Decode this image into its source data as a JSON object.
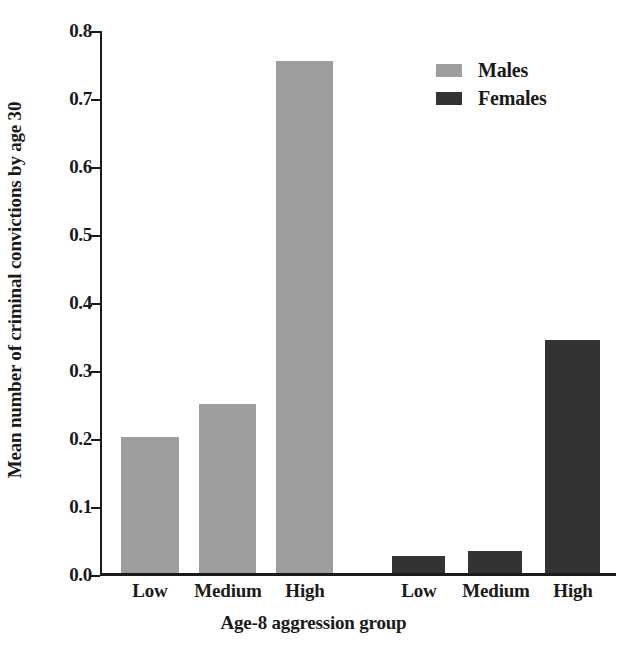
{
  "chart_data": {
    "type": "bar",
    "title": "",
    "xlabel": "Age-8 aggression group",
    "ylabel": "Mean number of criminal convictions by age 30",
    "categories": [
      "Low",
      "Medium",
      "High"
    ],
    "series": [
      {
        "name": "Males",
        "color": "#9e9e9e",
        "values": [
          0.2,
          0.248,
          0.753
        ]
      },
      {
        "name": "Females",
        "color": "#333333",
        "values": [
          0.025,
          0.032,
          0.342
        ]
      }
    ],
    "ylim": [
      0.0,
      0.8
    ],
    "yticks": [
      "0.0",
      "0.1",
      "0.2",
      "0.3",
      "0.4",
      "0.5",
      "0.6",
      "0.7",
      "0.8"
    ],
    "ytick_values": [
      0.0,
      0.1,
      0.2,
      0.3,
      0.4,
      0.5,
      0.6,
      0.7,
      0.8
    ],
    "grid": false,
    "legend_position": "top-right",
    "group_labels": [
      "Low",
      "Medium",
      "High",
      "Low",
      "Medium",
      "High"
    ]
  },
  "legend": {
    "entries": [
      {
        "label": "Males"
      },
      {
        "label": "Females"
      }
    ]
  },
  "axis": {
    "y_title": "Mean number of criminal convictions by age 30",
    "x_title": "Age-8 aggression group"
  },
  "xticks": [
    {
      "label": "Low"
    },
    {
      "label": "Medium"
    },
    {
      "label": "High"
    },
    {
      "label": "Low"
    },
    {
      "label": "Medium"
    },
    {
      "label": "High"
    }
  ],
  "yticks": [
    {
      "label": "0.8"
    },
    {
      "label": "0.7"
    },
    {
      "label": "0.6"
    },
    {
      "label": "0.5"
    },
    {
      "label": "0.4"
    },
    {
      "label": "0.3"
    },
    {
      "label": "0.2"
    },
    {
      "label": "0.1"
    },
    {
      "label": "0.0"
    }
  ]
}
